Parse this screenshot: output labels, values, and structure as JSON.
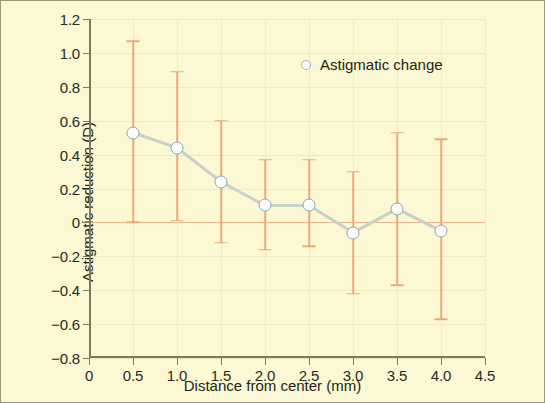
{
  "figure": {
    "background_color": "#fbf8d3",
    "border_color": "#9a9a7a"
  },
  "chart_data": {
    "type": "line",
    "title": "",
    "subtitle": "",
    "xlabel": "Distance from center (mm)",
    "ylabel": "Astigmatic reduction (D)",
    "xlim": [
      0,
      4.5
    ],
    "ylim": [
      -0.8,
      1.2
    ],
    "xticks": [
      0,
      0.5,
      1.0,
      1.5,
      2.0,
      2.5,
      3.0,
      3.5,
      4.0,
      4.5
    ],
    "xtick_labels": [
      "0",
      "0.5",
      "1.0",
      "1.5",
      "2.0",
      "2.5",
      "3.0",
      "3.5",
      "4.0",
      "4.5"
    ],
    "yticks": [
      1.2,
      1.0,
      0.8,
      0.6,
      0.4,
      0.2,
      0,
      -0.2,
      -0.4,
      -0.6,
      -0.8
    ],
    "ytick_labels": [
      "1.2",
      "1.0",
      "0.8",
      "0.6",
      "0.4",
      "0.2",
      "0",
      "−0.2",
      "−0.4",
      "−0.6",
      "−0.8"
    ],
    "grid": true,
    "zero_line": true,
    "legend_position": "top-right",
    "marker_style": "open-circle",
    "line_color": "#c9cfc9",
    "marker_edge_color": "#8fa5b8",
    "marker_face_color": "#fcfdfb",
    "errorbar_color": "#e9aa7c",
    "grid_color": "#efe9bb",
    "axis_color": "#7b7b5e",
    "x": [
      0.5,
      1.0,
      1.5,
      2.0,
      2.5,
      3.0,
      3.5,
      4.0
    ],
    "series": [
      {
        "name": "Astigmatic change",
        "values": [
          0.53,
          0.44,
          0.24,
          0.1,
          0.1,
          -0.06,
          0.08,
          -0.05
        ],
        "err_upper": [
          1.07,
          0.89,
          0.6,
          0.37,
          0.37,
          0.3,
          0.53,
          0.49
        ],
        "err_lower": [
          0.0,
          0.01,
          -0.12,
          -0.16,
          -0.14,
          -0.42,
          -0.37,
          -0.57
        ]
      }
    ],
    "legend": [
      {
        "label": "Astigmatic change",
        "marker": "open-circle"
      }
    ],
    "annotations": []
  }
}
